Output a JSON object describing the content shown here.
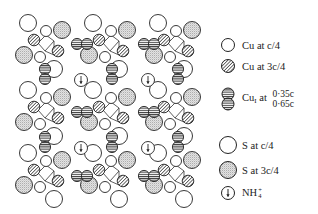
{
  "legend": {
    "cu_c4": {
      "symbol": "open-circle",
      "label": "Cu at c/4"
    },
    "cu_3c4": {
      "symbol": "hatched-circle",
      "label": "Cu at 3c/4"
    },
    "cu1": {
      "symbol": "striped-double-circle",
      "label_main": "Cu",
      "label_sub": "I",
      "label_at": "at",
      "heights": [
        "0·35c",
        "0·65c"
      ]
    },
    "s_c4": {
      "symbol": "large-open-circle",
      "label": "S at c/4"
    },
    "s_3c4": {
      "symbol": "large-stippled-circle",
      "label": "S at 3c/4"
    },
    "nh4": {
      "symbol": "circled-arrow",
      "label_main": "NH",
      "label_sub": "4",
      "label_sup": "+"
    }
  },
  "colors": {
    "line": "#222222",
    "hatch": "#333333",
    "stipple": "#999999",
    "background": "#ffffff"
  },
  "structure": {
    "unit_cell_repeat": 2,
    "nh4_positions": [
      [
        81,
        80
      ],
      [
        148,
        80
      ],
      [
        81,
        148
      ],
      [
        148,
        148
      ]
    ],
    "motif_note": "Cu/S chains with Cu(I) pairs between NH4+ channels"
  }
}
